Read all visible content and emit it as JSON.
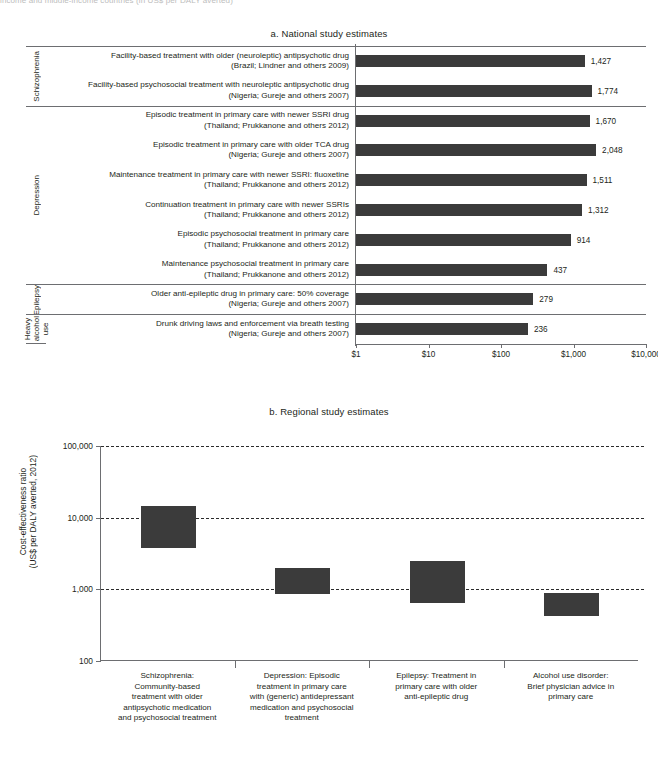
{
  "cut_header_text": "income and middle-income countries (in US$ per DALY averted)",
  "panel_a": {
    "title": "a. National study estimates",
    "axis": {
      "ticks": [
        "$1",
        "$10",
        "$100",
        "$1,000",
        "$10,000"
      ]
    },
    "groups": [
      {
        "label": "Schizophrenia",
        "rows": 2
      },
      {
        "label": "Depression",
        "rows": 6
      },
      {
        "label": "Epilepsy",
        "rows": 1
      },
      {
        "label": "Heavy\nalcohol\nuse",
        "rows": 1
      }
    ],
    "rows": [
      {
        "l1": "Facility-based treatment with older (neuroleptic) antipsychotic drug",
        "l2": "(Brazil; Lindner and others 2009)",
        "value": 1427,
        "value_label": "1,427"
      },
      {
        "l1": "Facility-based psychosocial treatment with neuroleptic antipsychotic drug",
        "l2": "(Nigeria; Gureje and others 2007)",
        "value": 1774,
        "value_label": "1,774"
      },
      {
        "l1": "Episodic treatment in primary care with newer SSRI drug",
        "l2": "(Thailand; Prukkanone and others 2012)",
        "value": 1670,
        "value_label": "1,670"
      },
      {
        "l1": "Episodic treatment in primary care with older TCA drug",
        "l2": "(Nigeria; Gureje and others 2007)",
        "value": 2048,
        "value_label": "2,048"
      },
      {
        "l1": "Maintenance treatment in primary care with newer SSRI: fluoxetine",
        "l2": "(Thailand; Prukkanone and others 2012)",
        "value": 1511,
        "value_label": "1,511"
      },
      {
        "l1": "Continuation treatment in primary care with newer SSRIs",
        "l2": "(Thailand; Prukkanone and others 2012)",
        "value": 1312,
        "value_label": "1,312"
      },
      {
        "l1": "Episodic psychosocial treatment in primary care",
        "l2": "(Thailand; Prukkanone and others 2012)",
        "value": 914,
        "value_label": "914"
      },
      {
        "l1": "Maintenance psychosocial treatment in primary care",
        "l2": "(Thailand; Prukkanone and others 2012)",
        "value": 437,
        "value_label": "437"
      },
      {
        "l1": "Older anti-epileptic drug in primary care: 50% coverage",
        "l2": "(Nigeria; Gureje and others 2007)",
        "value": 279,
        "value_label": "279"
      },
      {
        "l1": "Drunk driving laws and enforcement via breath testing",
        "l2": "(Nigeria; Gureje and others 2007)",
        "value": 236,
        "value_label": "236"
      }
    ]
  },
  "panel_b": {
    "title": "b. Regional study estimates",
    "ylabel": "Cost-effectiveness ratio\n(US$ per DALY averted, 2012)",
    "yticks": [
      "100,000",
      "10,000",
      "1,000",
      "100"
    ],
    "categories": [
      "Schizophrenia:\nCommunity-based\ntreatment with older\nantipsychotic medication\nand psychosocial treatment",
      "Depression: Episodic\ntreatment in primary care\nwith (generic) antidepressant\nmedication and psychosocial\ntreatment",
      "Epilepsy: Treatment in\nprimary care with older\nanti-epileptic drug",
      "Alcohol use disorder:\nBrief physician advice in\nprimary care"
    ],
    "ranges": [
      {
        "low": 3800,
        "high": 14500
      },
      {
        "low": 850,
        "high": 2000
      },
      {
        "low": 650,
        "high": 2450
      },
      {
        "low": 420,
        "high": 900
      }
    ]
  },
  "colors": {
    "bar": "#3b3b3b",
    "axis": "#6d6e71",
    "text": "#231f20"
  },
  "chart_data": [
    {
      "type": "bar",
      "title": "a. National study estimates",
      "orientation": "horizontal",
      "xlabel": "",
      "ylabel": "",
      "xscale": "log",
      "xlim": [
        1,
        10000
      ],
      "xticks": [
        1,
        10,
        100,
        1000,
        10000
      ],
      "xticklabels": [
        "$1",
        "$10",
        "$100",
        "$1,000",
        "$10,000"
      ],
      "grid": false,
      "legend": "none",
      "categories": [
        "Facility-based treatment with older (neuroleptic) antipsychotic drug (Brazil; Lindner and others 2009)",
        "Facility-based psychosocial treatment with neuroleptic antipsychotic drug (Nigeria; Gureje and others 2007)",
        "Episodic treatment in primary care with newer SSRI drug (Thailand; Prukkanone and others 2012)",
        "Episodic treatment in primary care with older TCA drug (Nigeria; Gureje and others 2007)",
        "Maintenance treatment in primary care with newer SSRI: fluoxetine (Thailand; Prukkanone and others 2012)",
        "Continuation treatment in primary care with newer SSRIs (Thailand; Prukkanone and others 2012)",
        "Episodic psychosocial treatment in primary care (Thailand; Prukkanone and others 2012)",
        "Maintenance psychosocial treatment in primary care (Thailand; Prukkanone and others 2012)",
        "Older anti-epileptic drug in primary care: 50% coverage (Nigeria; Gureje and others 2007)",
        "Drunk driving laws and enforcement via breath testing (Nigeria; Gureje and others 2007)"
      ],
      "values": [
        1427,
        1774,
        1670,
        2048,
        1511,
        1312,
        914,
        437,
        279,
        236
      ],
      "group_labels": [
        "Schizophrenia",
        "Depression",
        "Epilepsy",
        "Heavy alcohol use"
      ],
      "group_sizes": [
        2,
        6,
        1,
        1
      ]
    },
    {
      "type": "bar",
      "subtype": "range-box",
      "title": "b. Regional study estimates",
      "xlabel": "",
      "ylabel": "Cost-effectiveness ratio (US$ per DALY averted, 2012)",
      "yscale": "log",
      "ylim": [
        100,
        100000
      ],
      "yticks": [
        100,
        1000,
        10000,
        100000
      ],
      "yticklabels": [
        "100",
        "1,000",
        "10,000",
        "100,000"
      ],
      "grid": "horizontal-dashed",
      "legend": "none",
      "categories": [
        "Schizophrenia: Community-based treatment with older antipsychotic medication and psychosocial treatment",
        "Depression: Episodic treatment in primary care with (generic) antidepressant medication and psychosocial treatment",
        "Epilepsy: Treatment in primary care with older anti-epileptic drug",
        "Alcohol use disorder: Brief physician advice in primary care"
      ],
      "ranges_low": [
        3800,
        850,
        650,
        420
      ],
      "ranges_high": [
        14500,
        2000,
        2450,
        900
      ]
    }
  ]
}
